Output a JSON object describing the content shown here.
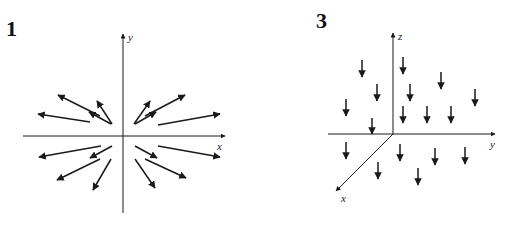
{
  "panels": [
    {
      "label": "1",
      "type": "2d-vector-field",
      "axes": {
        "x_label": "x",
        "y_label": "y"
      },
      "description": "Radial outward vector field; arrows point away from origin, longer farther out",
      "origin_px": [
        123,
        136
      ],
      "arrows": [
        [
          112,
          124,
          97,
          101
        ],
        [
          134,
          124,
          150,
          101
        ],
        [
          100,
          116,
          58,
          95
        ],
        [
          145,
          116,
          185,
          95
        ],
        [
          111,
          124,
          89,
          112
        ],
        [
          135,
          124,
          156,
          112
        ],
        [
          90,
          122,
          38,
          114
        ],
        [
          158,
          125,
          220,
          114
        ],
        [
          101,
          146,
          39,
          157
        ],
        [
          158,
          146,
          220,
          157
        ],
        [
          112,
          146,
          90,
          158
        ],
        [
          135,
          146,
          157,
          158
        ],
        [
          100,
          159,
          57,
          180
        ],
        [
          145,
          159,
          186,
          178
        ],
        [
          111,
          159,
          93,
          190
        ],
        [
          135,
          159,
          155,
          188
        ]
      ]
    },
    {
      "label": "3",
      "type": "3d-vector-field",
      "axes": {
        "x_label": "x",
        "y_label": "y",
        "z_label": "z"
      },
      "description": "Constant vector field pointing in negative z direction",
      "origin_px": [
        393,
        134
      ],
      "arrows": [
        [
          362,
          60,
          362,
          77
        ],
        [
          403,
          57,
          403,
          74
        ],
        [
          377,
          84,
          377,
          101
        ],
        [
          410,
          84,
          410,
          101
        ],
        [
          441,
          72,
          441,
          89
        ],
        [
          475,
          89,
          475,
          106
        ],
        [
          346,
          99,
          346,
          116
        ],
        [
          403,
          106,
          403,
          123
        ],
        [
          427,
          106,
          427,
          123
        ],
        [
          451,
          106,
          451,
          123
        ],
        [
          372,
          118,
          372,
          134
        ],
        [
          346,
          142,
          346,
          159
        ],
        [
          400,
          144,
          400,
          161
        ],
        [
          435,
          148,
          435,
          165
        ],
        [
          465,
          147,
          465,
          164
        ],
        [
          378,
          162,
          378,
          179
        ],
        [
          418,
          168,
          418,
          185
        ]
      ]
    }
  ],
  "colors": {
    "ink": "#1a1a1a",
    "background": "#ffffff"
  }
}
